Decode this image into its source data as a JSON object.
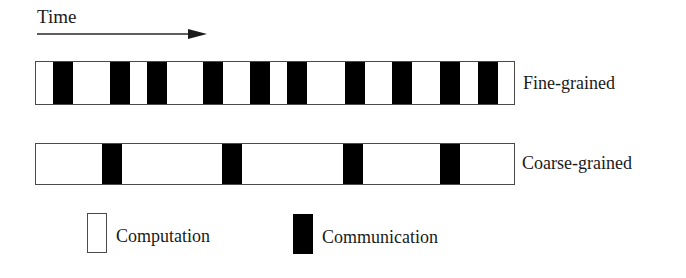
{
  "time_axis": {
    "label": "Time",
    "arrow_direction": "right"
  },
  "rows": [
    {
      "label": "Fine-grained",
      "communication_bars_x": [
        53,
        110,
        147,
        203,
        250,
        287,
        345,
        392,
        440,
        478
      ],
      "bar_width": 20
    },
    {
      "label": "Coarse-grained",
      "communication_bars_x": [
        102,
        222,
        343,
        440
      ],
      "bar_width": 20
    }
  ],
  "legend": {
    "computation": {
      "label": "Computation",
      "color": "#ffffff"
    },
    "communication": {
      "label": "Communication",
      "color": "#000000"
    }
  },
  "colors": {
    "outline": "#4a4a4a",
    "communication": "#000000",
    "computation": "#ffffff",
    "text": "#1a1a1a"
  },
  "layout": {
    "timeline_left": 35
  }
}
